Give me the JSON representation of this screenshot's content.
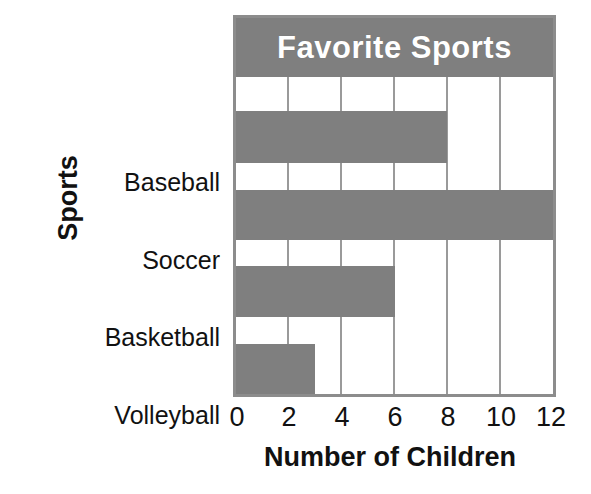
{
  "chart_data": {
    "type": "bar",
    "orientation": "horizontal",
    "title": "Favorite Sports",
    "xlabel": "Number of Children",
    "ylabel": "Sports",
    "categories": [
      "Baseball",
      "Soccer",
      "Basketball",
      "Volleyball"
    ],
    "values": [
      8,
      12,
      6,
      3
    ],
    "xticks": [
      "0",
      "2",
      "4",
      "6",
      "8",
      "10",
      "12"
    ],
    "xtick_values": [
      0,
      2,
      4,
      6,
      8,
      10,
      12
    ],
    "xlim": [
      0,
      12
    ],
    "grid": "vertical",
    "legend": "none",
    "bar_color": "#7f7f7f",
    "title_band_color": "#7f7f7f",
    "title_text_color": "#ffffff",
    "plot_background": "#ffffff",
    "axis_color": "#8c8c8c",
    "gridline_color": "#9a9a9a",
    "text_color": "#111111"
  }
}
